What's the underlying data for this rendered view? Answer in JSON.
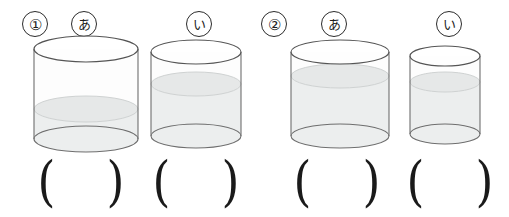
{
  "page": {
    "background_color": "#ffffff",
    "ink_color": "#231f20"
  },
  "style": {
    "glass_outline_color": "#6b6b6b",
    "glass_outline_dark": "#4a4a4a",
    "water_fill_color": "#e8eaea",
    "water_surface_color": "#dcdede",
    "glass_body_fill": "#fdfdfd"
  },
  "problems": [
    {
      "number_label": "①",
      "number_name": "problem-1",
      "containers": [
        {
          "label": "あ",
          "name": "container-1-a",
          "width_px": 110,
          "height_px": 112,
          "water_fill_ratio": 0.34,
          "answer_value": ""
        },
        {
          "label": "い",
          "name": "container-1-i",
          "width_px": 96,
          "height_px": 106,
          "water_fill_ratio": 0.62,
          "answer_value": ""
        }
      ]
    },
    {
      "number_label": "②",
      "number_name": "problem-2",
      "containers": [
        {
          "label": "あ",
          "name": "container-2-a",
          "width_px": 105,
          "height_px": 106,
          "water_fill_ratio": 0.72,
          "answer_value": ""
        },
        {
          "label": "い",
          "name": "container-2-i",
          "width_px": 72,
          "height_px": 96,
          "water_fill_ratio": 0.68,
          "answer_value": ""
        }
      ]
    }
  ],
  "answer_brackets": {
    "open_paren": "(",
    "close_paren": ")",
    "count": 4
  }
}
